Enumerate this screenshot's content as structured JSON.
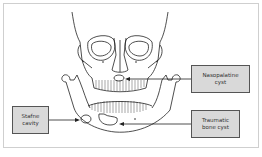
{
  "diagram": {
    "labels": [
      {
        "id": "nasopalatine",
        "text": "Nasopalatine\ncyst"
      },
      {
        "id": "traumatic",
        "text": "Traumatic\nbone cyst"
      },
      {
        "id": "stafne",
        "text": "Stafne\ncavity"
      }
    ],
    "colors": {
      "line": "#222222",
      "box_fill": "#d9d9d9",
      "box_border": "#555555",
      "frame": "#cfcfcf"
    }
  }
}
